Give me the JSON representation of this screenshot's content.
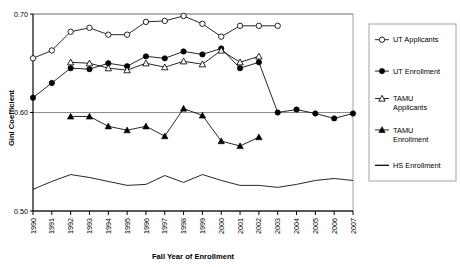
{
  "chart_data": {
    "type": "line",
    "title": "",
    "xlabel": "Fall Year of Enrollment",
    "ylabel": "Gini Coefficient",
    "xlim": [
      1990,
      2007
    ],
    "ylim": [
      0.5,
      0.7
    ],
    "yticks": [
      0.5,
      0.6,
      0.7
    ],
    "ytick_labels": [
      "0.50",
      "0.60",
      "0.70"
    ],
    "categories": [
      1990,
      1991,
      1992,
      1993,
      1994,
      1995,
      1996,
      1997,
      1998,
      1999,
      2000,
      2001,
      2002,
      2003,
      2004,
      2005,
      2006,
      2007
    ],
    "xtick_labels": [
      "1990",
      "1991",
      "1992",
      "1993",
      "1994",
      "1995",
      "1996",
      "1997",
      "1998",
      "1999",
      "2000",
      "2001",
      "2002",
      "2003",
      "2004",
      "2005",
      "2006",
      "2007"
    ],
    "grid": true,
    "legend_position": "right",
    "series": [
      {
        "name": "UT Applicants",
        "marker": "open-circle",
        "x": [
          1990,
          1991,
          1992,
          1993,
          1994,
          1995,
          1996,
          1997,
          1998,
          1999,
          2000,
          2001,
          2002,
          2003
        ],
        "values": [
          0.655,
          0.663,
          0.682,
          0.686,
          0.679,
          0.679,
          0.692,
          0.693,
          0.698,
          0.69,
          0.677,
          0.688,
          0.688,
          0.688
        ]
      },
      {
        "name": "UT Enrollment",
        "marker": "filled-circle",
        "x": [
          1990,
          1991,
          1992,
          1993,
          1994,
          1995,
          1996,
          1997,
          1998,
          1999,
          2000,
          2001,
          2002,
          2003,
          2004,
          2005,
          2006,
          2007
        ],
        "values": [
          0.615,
          0.63,
          0.645,
          0.644,
          0.65,
          0.647,
          0.657,
          0.655,
          0.662,
          0.659,
          0.665,
          0.645,
          0.651,
          0.6,
          0.603,
          0.599,
          0.594,
          0.599
        ]
      },
      {
        "name": "TAMU Applicants",
        "marker": "open-triangle",
        "x": [
          1992,
          1993,
          1994,
          1995,
          1996,
          1997,
          1998,
          1999,
          2000,
          2001,
          2002
        ],
        "values": [
          0.651,
          0.65,
          0.645,
          0.643,
          0.65,
          0.646,
          0.652,
          0.649,
          0.663,
          0.651,
          0.657
        ]
      },
      {
        "name": "TAMU Enrollment",
        "marker": "filled-triangle",
        "x": [
          1992,
          1993,
          1994,
          1995,
          1996,
          1997,
          1998,
          1999,
          2000,
          2001,
          2002
        ],
        "values": [
          0.596,
          0.596,
          0.586,
          0.582,
          0.586,
          0.576,
          0.604,
          0.597,
          0.571,
          0.566,
          0.575
        ]
      },
      {
        "name": "HS Enrollment",
        "marker": "none",
        "x": [
          1990,
          1991,
          1992,
          1993,
          1994,
          1995,
          1996,
          1997,
          1998,
          1999,
          2000,
          2001,
          2002,
          2003,
          2004,
          2005,
          2006,
          2007
        ],
        "values": [
          0.522,
          0.53,
          0.537,
          0.534,
          0.53,
          0.526,
          0.527,
          0.536,
          0.529,
          0.537,
          0.531,
          0.526,
          0.526,
          0.524,
          0.527,
          0.531,
          0.533,
          0.531
        ]
      }
    ]
  },
  "legend": {
    "entries": [
      {
        "label": "UT Applicants",
        "label2": "",
        "marker": "open-circle"
      },
      {
        "label": "UT Enrollment",
        "label2": "",
        "marker": "filled-circle"
      },
      {
        "label": "TAMU",
        "label2": "Applicants",
        "marker": "open-triangle"
      },
      {
        "label": "TAMU",
        "label2": "Enrollment",
        "marker": "filled-triangle"
      },
      {
        "label": "HS Enrollment",
        "label2": "",
        "marker": "line"
      }
    ]
  },
  "colors": {
    "series": "#000000",
    "grid": "#808080",
    "axis": "#000000",
    "background": "#ffffff"
  }
}
